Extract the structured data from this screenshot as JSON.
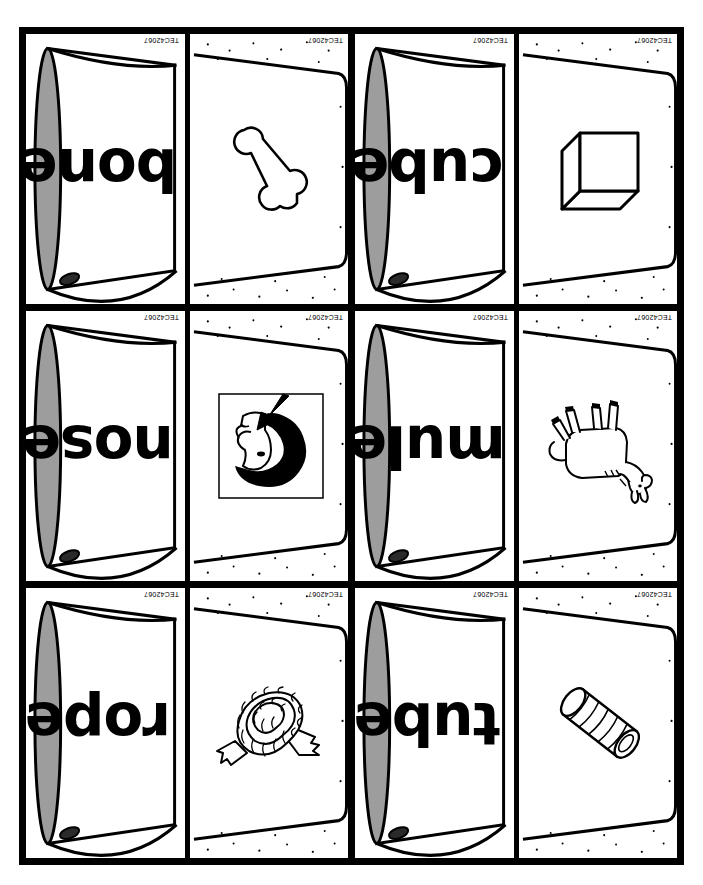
{
  "page": {
    "kind": "printable-flashcard-sheet",
    "product_code": "TEC42067",
    "rows": 3,
    "columns": 2,
    "background_color": "#ffffff",
    "line_color": "#000000",
    "rim_fill_color": "#9d9d9d"
  },
  "cards": [
    {
      "word": "bone",
      "picture": "bone-illustration",
      "word_code": "TEC42067",
      "picture_code": "TEC42067"
    },
    {
      "word": "cube",
      "picture": "cube-illustration",
      "word_code": "TEC42067",
      "picture_code": "TEC42067"
    },
    {
      "word": "nose",
      "picture": "nose-face-profile-illustration",
      "word_code": "TEC42067",
      "picture_code": "TEC42067"
    },
    {
      "word": "mule",
      "picture": "mule-illustration",
      "word_code": "TEC42067",
      "picture_code": "TEC42067"
    },
    {
      "word": "rope",
      "picture": "rope-coil-illustration",
      "word_code": "TEC42067",
      "picture_code": "TEC42067"
    },
    {
      "word": "tube",
      "picture": "tube-illustration",
      "word_code": "TEC42067",
      "picture_code": "TEC42067"
    }
  ]
}
